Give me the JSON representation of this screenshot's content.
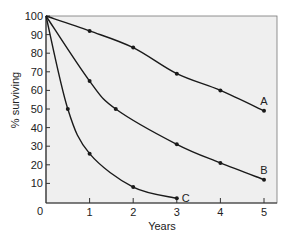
{
  "chart_data": {
    "type": "line",
    "title": "",
    "xlabel": "Years",
    "ylabel": "% surviving",
    "xlim": [
      0,
      5.3
    ],
    "ylim": [
      0,
      100
    ],
    "x_ticks": [
      0,
      1,
      2,
      3,
      4,
      5
    ],
    "y_ticks": [
      10,
      20,
      30,
      40,
      50,
      60,
      70,
      80,
      90,
      100
    ],
    "origin_label": "0",
    "grid": false,
    "legend": "inline labels at line ends",
    "series": [
      {
        "name": "A",
        "points": [
          [
            0,
            100
          ],
          [
            1,
            92
          ],
          [
            2,
            83
          ],
          [
            3,
            69
          ],
          [
            4,
            60
          ],
          [
            5,
            49
          ]
        ]
      },
      {
        "name": "B",
        "points": [
          [
            0,
            100
          ],
          [
            1,
            65
          ],
          [
            1.6,
            50
          ],
          [
            3,
            31
          ],
          [
            4,
            21
          ],
          [
            5,
            12
          ]
        ]
      },
      {
        "name": "C",
        "points": [
          [
            0,
            100
          ],
          [
            0.5,
            50
          ],
          [
            1,
            26
          ],
          [
            2,
            8
          ],
          [
            3,
            2
          ]
        ]
      }
    ]
  },
  "colors": {
    "plot_background": "#efefef",
    "line": "#1a1a1a",
    "axis": "#333333"
  }
}
